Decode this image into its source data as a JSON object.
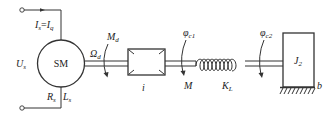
{
  "diagram": {
    "type": "electromechanical drive system schematic",
    "motor": {
      "label": "SM"
    },
    "supply": {
      "voltage": {
        "main": "U",
        "sub": "s"
      },
      "current": {
        "main1": "I",
        "sub1": "s",
        "eq": "=",
        "main2": "I",
        "sub2": "q"
      },
      "resistance": {
        "main": "R",
        "sub": "s"
      },
      "inductance": {
        "main": "L",
        "sub": "s"
      }
    },
    "motor_shaft": {
      "speed": {
        "main": "Ω",
        "sub": "d"
      },
      "torque": {
        "main": "M",
        "sub": "d"
      }
    },
    "gearbox": {
      "label": "i"
    },
    "output_shaft": {
      "angle1": {
        "main": "φ",
        "sub": "c1"
      },
      "torque": {
        "main": "M"
      }
    },
    "spring": {
      "stiffness": {
        "main": "K",
        "sub": "L"
      }
    },
    "load": {
      "angle2": {
        "main": "φ",
        "sub": "c2"
      },
      "inertia": {
        "main": "J",
        "sub": "2"
      },
      "damping": {
        "main": "b"
      }
    },
    "colors": {
      "line": "#333333",
      "text": "#222222",
      "background": "#ffffff"
    }
  }
}
